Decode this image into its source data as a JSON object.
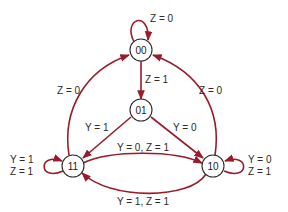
{
  "diagram": {
    "type": "state-diagram",
    "colors": {
      "edge": "#9b1b2a",
      "node_stroke": "#2b2b2b",
      "text": "#2a2a2a"
    },
    "states": [
      {
        "id": "00",
        "label": "00"
      },
      {
        "id": "01",
        "label": "01"
      },
      {
        "id": "11",
        "label": "11"
      },
      {
        "id": "10",
        "label": "10"
      }
    ],
    "transitions": [
      {
        "from": "00",
        "to": "00",
        "label": "Z = 0"
      },
      {
        "from": "00",
        "to": "01",
        "label": "Z = 1"
      },
      {
        "from": "11",
        "to": "00",
        "label": "Z = 0"
      },
      {
        "from": "10",
        "to": "00",
        "label": "Z = 0"
      },
      {
        "from": "01",
        "to": "11",
        "label": "Y = 1"
      },
      {
        "from": "01",
        "to": "10",
        "label": "Y = 0"
      },
      {
        "from": "11",
        "to": "10",
        "label": "Y = 0, Z = 1"
      },
      {
        "from": "10",
        "to": "11",
        "label": "Y = 1, Z = 1"
      },
      {
        "from": "11",
        "to": "11",
        "label_line1": "Y = 1",
        "label_line2": "Z = 1"
      },
      {
        "from": "10",
        "to": "10",
        "label_line1": "Y = 0",
        "label_line2": "Z = 1"
      }
    ]
  }
}
